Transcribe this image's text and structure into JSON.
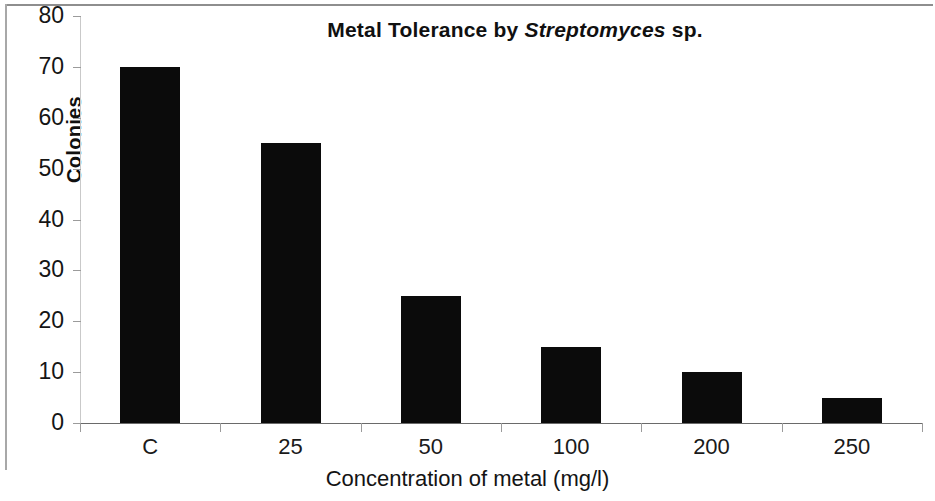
{
  "chart_data": {
    "type": "bar",
    "title": "Metal Tolerance by Streptomyces sp.",
    "title_parts": {
      "prefix": "Metal Tolerance by ",
      "italic": "Streptomyces",
      "suffix": " sp."
    },
    "xlabel": "Concentration of metal (mg/l)",
    "ylabel": "Colonies",
    "categories": [
      "C",
      "25",
      "50",
      "100",
      "200",
      "250"
    ],
    "values": [
      70,
      55,
      25,
      15,
      10,
      5
    ],
    "ylim": [
      0,
      80
    ],
    "ytick_values": [
      0,
      10,
      20,
      30,
      40,
      50,
      60,
      70,
      80
    ],
    "ytick_labels": [
      "0",
      "10",
      "20",
      "30",
      "40",
      "50",
      "60",
      "70",
      "80"
    ],
    "grid": false,
    "legend": null,
    "bar_color": "#0b0b0b",
    "axis_color": "#6a6a6a",
    "background": "#ffffff"
  }
}
